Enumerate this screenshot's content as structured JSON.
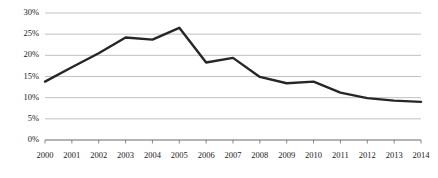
{
  "chart_data": {
    "type": "line",
    "title": "",
    "subtitle": "",
    "xlabel": "",
    "ylabel": "",
    "categories": [
      "2000",
      "2001",
      "2002",
      "2003",
      "2004",
      "2005",
      "2006",
      "2007",
      "2008",
      "2009",
      "2010",
      "2011",
      "2012",
      "2013",
      "2014"
    ],
    "values": [
      13.8,
      17.2,
      20.5,
      24.2,
      23.7,
      26.5,
      18.3,
      19.4,
      14.9,
      13.4,
      13.8,
      11.2,
      9.9,
      9.3,
      9.0
    ],
    "series": [
      {
        "name": "",
        "values": [
          13.8,
          17.2,
          20.5,
          24.2,
          23.7,
          26.5,
          18.3,
          19.4,
          14.9,
          13.4,
          13.8,
          11.2,
          9.9,
          9.3,
          9.0
        ]
      }
    ],
    "ylim": [
      0,
      30
    ],
    "ytick_values": [
      0,
      5,
      10,
      15,
      20,
      25,
      30
    ],
    "ytick_labels": [
      "0%",
      "5%",
      "10%",
      "15%",
      "20%",
      "25%",
      "30%"
    ],
    "xtick_labels": [
      "2000",
      "2001",
      "2002",
      "2003",
      "2004",
      "2005",
      "2006",
      "2007",
      "2008",
      "2009",
      "2010",
      "2011",
      "2012",
      "2013",
      "2014"
    ],
    "grid": true,
    "grid_axis": "y",
    "legend": false,
    "legend_position": "none",
    "markers": false,
    "annotations": []
  },
  "style": {
    "line_color": "#262626",
    "grid_color": "#a6a6a6",
    "axis_color": "#595959",
    "background": "#ffffff",
    "text_color": "#1a1a1a",
    "line_width": "2.4"
  },
  "plot_geometry": {
    "left": 45,
    "right": 421,
    "top": 13,
    "bottom": 140
  }
}
